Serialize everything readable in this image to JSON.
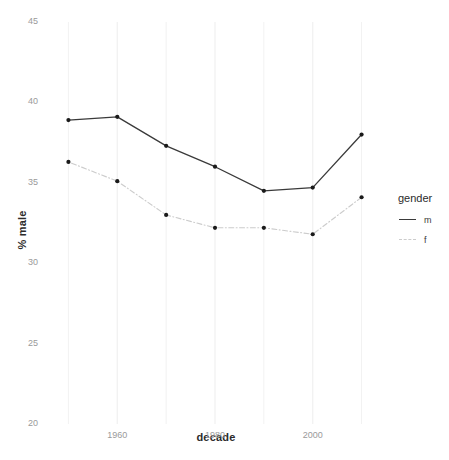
{
  "chart_data": {
    "type": "line",
    "title": "",
    "xlabel": "decade",
    "ylabel": "% male",
    "x": [
      1950,
      1960,
      1970,
      1980,
      1990,
      2000,
      2010
    ],
    "xlim": [
      1945,
      2015
    ],
    "ylim": [
      20,
      45
    ],
    "xticks": [
      "1960",
      "1980",
      "2000"
    ],
    "xtick_values": [
      1960,
      1980,
      2000
    ],
    "yticks": [
      "20",
      "25",
      "30",
      "35",
      "40",
      "45"
    ],
    "ytick_values": [
      20,
      25,
      30,
      35,
      40,
      45
    ],
    "grid": true,
    "grid_minor_values_x": [
      1950,
      1970,
      1990,
      2010
    ],
    "legend": {
      "title": "gender",
      "position": "right",
      "entries": [
        {
          "name": "m",
          "color": "#3a3a3a",
          "style": "solid"
        },
        {
          "name": "f",
          "color": "#cccccc",
          "style": "dotdash"
        }
      ]
    },
    "series": [
      {
        "name": "m",
        "color": "#3a3a3a",
        "style": "solid",
        "values": [
          38.9,
          39.1,
          37.3,
          36.0,
          34.5,
          34.7,
          38.0
        ]
      },
      {
        "name": "f",
        "color": "#cccccc",
        "style": "dotdash",
        "values": [
          36.3,
          35.1,
          33.0,
          32.2,
          32.2,
          31.8,
          34.1
        ]
      }
    ]
  },
  "colors": {
    "background": "#ffffff",
    "grid": "#f2f2f2",
    "tick_text": "#9a9a9a",
    "title_text": "#2b2b2b",
    "point": "#1a1a1a"
  }
}
